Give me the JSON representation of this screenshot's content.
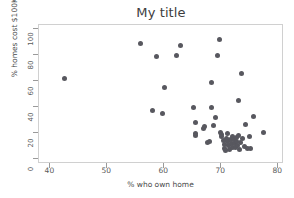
{
  "chart_data": {
    "type": "scatter",
    "title": "My title",
    "xlabel": "% who own home",
    "ylabel": "% homes cost $100K+",
    "xlim": [
      38,
      81
    ],
    "ylim": [
      -4,
      103
    ],
    "xticks": [
      40,
      50,
      60,
      70,
      80
    ],
    "yticks": [
      0,
      20,
      40,
      60,
      80,
      100
    ],
    "grid": false,
    "legend": null,
    "marker": {
      "shape": "circle",
      "color": "#58585f",
      "size_px": 5
    },
    "series": [
      {
        "name": "states",
        "points": [
          [
            42.5,
            62.0
          ],
          [
            55.8,
            89.0
          ],
          [
            57.9,
            37.5
          ],
          [
            58.6,
            79.0
          ],
          [
            59.6,
            35.0
          ],
          [
            60.1,
            54.8
          ],
          [
            62.1,
            79.5
          ],
          [
            62.8,
            87.5
          ],
          [
            65.2,
            39.5
          ],
          [
            65.4,
            27.8
          ],
          [
            65.4,
            19.5
          ],
          [
            65.5,
            17.8
          ],
          [
            66.8,
            23.5
          ],
          [
            67.0,
            25.0
          ],
          [
            67.6,
            12.5
          ],
          [
            68.0,
            13.0
          ],
          [
            68.2,
            39.8
          ],
          [
            68.3,
            58.5
          ],
          [
            68.6,
            25.8
          ],
          [
            68.9,
            31.8
          ],
          [
            69.3,
            79.5
          ],
          [
            69.6,
            91.5
          ],
          [
            69.8,
            20.5
          ],
          [
            70.0,
            19.0
          ],
          [
            70.1,
            17.0
          ],
          [
            70.3,
            14.0
          ],
          [
            70.5,
            11.0
          ],
          [
            70.6,
            8.0
          ],
          [
            70.7,
            6.5
          ],
          [
            70.9,
            16.0
          ],
          [
            71.0,
            13.5
          ],
          [
            71.1,
            19.5
          ],
          [
            71.3,
            10.0
          ],
          [
            71.4,
            7.5
          ],
          [
            71.6,
            15.0
          ],
          [
            71.7,
            12.0
          ],
          [
            71.9,
            9.0
          ],
          [
            72.0,
            17.5
          ],
          [
            72.1,
            14.5
          ],
          [
            72.3,
            11.5
          ],
          [
            72.4,
            8.5
          ],
          [
            72.6,
            16.5
          ],
          [
            72.7,
            13.0
          ],
          [
            72.9,
            10.5
          ],
          [
            73.0,
            45.0
          ],
          [
            73.1,
            18.0
          ],
          [
            73.2,
            7.0
          ],
          [
            73.4,
            12.5
          ],
          [
            73.6,
            66.0
          ],
          [
            73.8,
            15.5
          ],
          [
            74.1,
            9.5
          ],
          [
            74.3,
            26.5
          ],
          [
            74.6,
            8.0
          ],
          [
            74.9,
            17.5
          ],
          [
            75.1,
            8.0
          ],
          [
            75.6,
            32.5
          ],
          [
            77.4,
            20.0
          ]
        ]
      }
    ]
  },
  "axis": {
    "xtick_labels": [
      "40",
      "50",
      "60",
      "70",
      "80"
    ],
    "ytick_labels": [
      "0",
      "20",
      "40",
      "60",
      "80",
      "100"
    ]
  }
}
